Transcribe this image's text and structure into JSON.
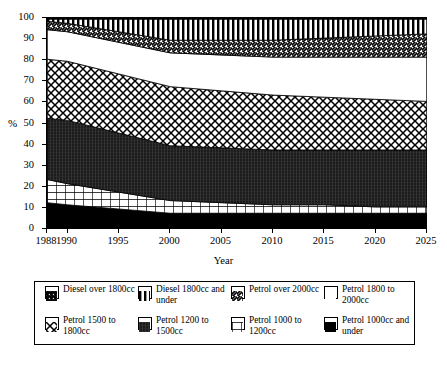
{
  "chart_data": {
    "type": "area",
    "subtype": "stacked-area-100-percent",
    "title": "",
    "xlabel": "Year",
    "ylabel": "%",
    "xlim": [
      1988,
      2025
    ],
    "ylim": [
      0,
      100
    ],
    "yticks": [
      0,
      10,
      20,
      30,
      40,
      50,
      60,
      70,
      80,
      90,
      100
    ],
    "xticks": [
      1988,
      1990,
      1995,
      2000,
      2005,
      2010,
      2015,
      2020,
      2025
    ],
    "grid": false,
    "legend_position": "below",
    "x": [
      1988,
      1990,
      1995,
      2000,
      2005,
      2010,
      2015,
      2020,
      2025
    ],
    "stack_order_bottom_to_top": [
      "Petrol 1000cc and under",
      "Petrol 1000 to 1200cc",
      "Petrol 1200 to 1500cc",
      "Petrol 1500 to 1800cc",
      "Petrol 1800 to 2000cc",
      "Petrol over 2000cc",
      "Diesel 1800cc and under",
      "Diesel over 1800cc"
    ],
    "series": [
      {
        "name": "Petrol 1000cc and under",
        "pattern": "solid-black",
        "values": [
          12,
          11,
          9,
          7,
          7,
          7,
          7,
          7,
          7
        ]
      },
      {
        "name": "Petrol 1000 to 1200cc",
        "pattern": "grid-lines",
        "values": [
          11,
          10,
          8,
          6,
          5,
          4,
          4,
          3,
          3
        ]
      },
      {
        "name": "Petrol 1200 to 1500cc",
        "pattern": "dense-dark-fill",
        "values": [
          29,
          30,
          28,
          26,
          26,
          26,
          26,
          27,
          27
        ]
      },
      {
        "name": "Petrol 1500 to 1800cc",
        "pattern": "cross-diamond",
        "values": [
          28,
          28,
          28,
          28,
          27,
          26,
          25,
          24,
          23
        ]
      },
      {
        "name": "Petrol 1800 to 2000cc",
        "pattern": "white-blank",
        "values": [
          14,
          14,
          15,
          16,
          17,
          18,
          19,
          20,
          21
        ]
      },
      {
        "name": "Petrol over 2000cc",
        "pattern": "diagonal-hatch",
        "values": [
          4,
          4,
          5,
          6,
          7,
          8,
          9,
          10,
          11
        ]
      },
      {
        "name": "Diesel 1800cc and under",
        "pattern": "vertical-bars",
        "values": [
          1,
          2,
          6,
          10,
          10,
          10,
          9,
          8,
          7
        ]
      },
      {
        "name": "Diesel over 1800cc",
        "pattern": "dense-diagonal",
        "values": [
          1,
          1,
          1,
          1,
          1,
          1,
          1,
          1,
          1
        ]
      }
    ],
    "cumulative_top_boundaries": {
      "note": "Cumulative stacked top edge (%) per series, bottom-to-top, at each x tick",
      "Petrol 1000cc and under": [
        12,
        11,
        9,
        7,
        7,
        7,
        7,
        7,
        7
      ],
      "Petrol 1000 to 1200cc": [
        23,
        21,
        17,
        13,
        12,
        11,
        11,
        10,
        10
      ],
      "Petrol 1200 to 1500cc": [
        52,
        51,
        45,
        39,
        38,
        37,
        37,
        37,
        37
      ],
      "Petrol 1500 to 1800cc": [
        80,
        79,
        73,
        67,
        65,
        63,
        62,
        61,
        60
      ],
      "Petrol 1800 to 2000cc": [
        94,
        93,
        88,
        83,
        82,
        81,
        81,
        81,
        81
      ],
      "Petrol over 2000cc": [
        98,
        97,
        93,
        89,
        89,
        89,
        90,
        91,
        92
      ],
      "Diesel 1800cc and under": [
        99,
        99,
        99,
        99,
        99,
        99,
        99,
        99,
        99
      ],
      "Diesel over 1800cc": [
        100,
        100,
        100,
        100,
        100,
        100,
        100,
        100,
        100
      ]
    }
  },
  "axes": {
    "ylabel": "%",
    "xlabel": "Year",
    "yticks": [
      "100",
      "90",
      "80",
      "70",
      "60",
      "50",
      "40",
      "30",
      "20",
      "10",
      "0"
    ],
    "xticks": [
      "1988",
      "1990",
      "1995",
      "2000",
      "2005",
      "2010",
      "2015",
      "2020",
      "2025"
    ]
  },
  "legend": {
    "items": [
      {
        "label": "Diesel over 1800cc",
        "swatch": "dense-diagonal-swatch"
      },
      {
        "label": "Diesel 1800cc and under",
        "swatch": "vertical-bars-swatch"
      },
      {
        "label": "Petrol over 2000cc",
        "swatch": "diagonal-hatch-swatch"
      },
      {
        "label": "Petrol 1800 to 2000cc",
        "swatch": "white-blank-swatch"
      },
      {
        "label": "Petrol 1500 to 1800cc",
        "swatch": "cross-diamond-swatch"
      },
      {
        "label": "Petrol 1200 to 1500cc",
        "swatch": "dense-dark-swatch"
      },
      {
        "label": "Petrol 1000 to 1200cc",
        "swatch": "grid-lines-swatch"
      },
      {
        "label": "Petrol 1000cc and under",
        "swatch": "solid-black-swatch"
      }
    ]
  },
  "colors": {
    "ink": "#000000",
    "paper": "#ffffff"
  }
}
